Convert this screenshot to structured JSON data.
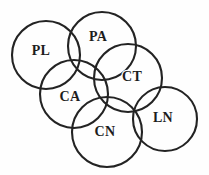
{
  "figure": {
    "type": "venn-circle-diagram",
    "background_color": "#fefefe",
    "stroke_color": "#232323",
    "label_color": "#1d1d1d",
    "width": 209,
    "height": 175
  },
  "circles": [
    {
      "id": "PL",
      "label": "PL",
      "cx": 46,
      "cy": 55,
      "r": 34,
      "label_x": 41,
      "label_y": 52
    },
    {
      "id": "PA",
      "label": "PA",
      "cx": 102,
      "cy": 46,
      "r": 34,
      "label_x": 98,
      "label_y": 38
    },
    {
      "id": "CT",
      "label": "CT",
      "cx": 128,
      "cy": 78,
      "r": 34,
      "label_x": 132,
      "label_y": 78
    },
    {
      "id": "CA",
      "label": "CA",
      "cx": 74,
      "cy": 94,
      "r": 34,
      "label_x": 70,
      "label_y": 98
    },
    {
      "id": "CN",
      "label": "CN",
      "cx": 107,
      "cy": 132,
      "r": 35,
      "label_x": 105,
      "label_y": 133
    },
    {
      "id": "LN",
      "label": "LN",
      "cx": 165,
      "cy": 119,
      "r": 32,
      "label_x": 163,
      "label_y": 119
    }
  ]
}
